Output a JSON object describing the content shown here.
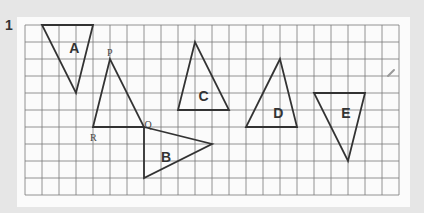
{
  "question_number": "1",
  "grid": {
    "origin_x": 25,
    "origin_y": 25,
    "cell": 17,
    "cols": 22,
    "rows": 10,
    "line_color": "#7a7a7a",
    "shape_color": "#333333"
  },
  "shapes": [
    {
      "label": "A",
      "vertices": [
        [
          1,
          0
        ],
        [
          4,
          0
        ],
        [
          3,
          4
        ]
      ],
      "label_pos": [
        2.6,
        1.3
      ]
    },
    {
      "label": "",
      "vertices": [
        [
          5,
          2
        ],
        [
          4,
          6
        ],
        [
          7,
          6
        ]
      ],
      "vertex_labels": [
        {
          "text": "P",
          "pos": [
            5,
            1.6
          ]
        },
        {
          "text": "R",
          "pos": [
            4,
            6.6
          ]
        },
        {
          "text": "Q",
          "pos": [
            7.2,
            5.8
          ]
        }
      ]
    },
    {
      "label": "B",
      "vertices": [
        [
          7,
          6
        ],
        [
          11,
          7
        ],
        [
          7,
          9
        ]
      ],
      "label_pos": [
        8,
        7.7
      ]
    },
    {
      "label": "C",
      "vertices": [
        [
          10,
          1
        ],
        [
          9,
          5
        ],
        [
          12,
          5
        ]
      ],
      "label_pos": [
        10.2,
        4.1
      ]
    },
    {
      "label": "D",
      "vertices": [
        [
          15,
          2
        ],
        [
          13,
          6
        ],
        [
          16,
          6
        ]
      ],
      "label_pos": [
        14.6,
        5.1
      ]
    },
    {
      "label": "E",
      "vertices": [
        [
          17,
          4
        ],
        [
          20,
          4
        ],
        [
          19,
          8
        ]
      ],
      "label_pos": [
        18.6,
        5.1
      ]
    }
  ]
}
